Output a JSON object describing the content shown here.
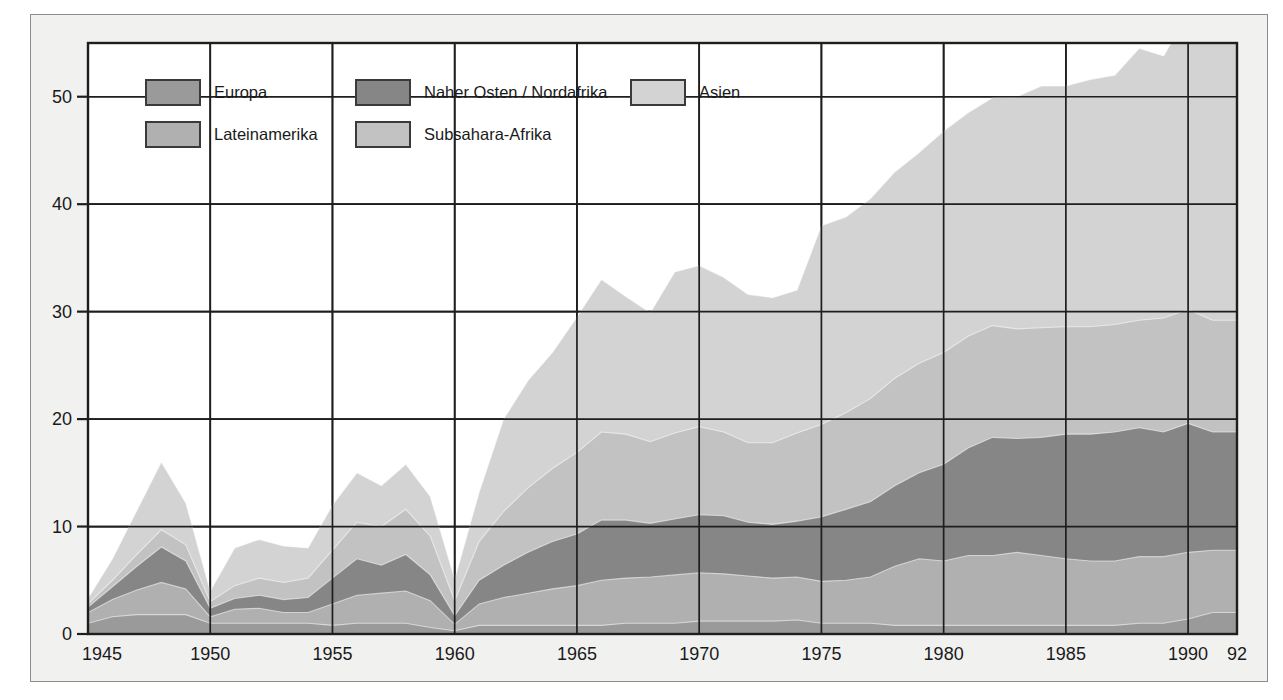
{
  "figure": {
    "background": "#ffffff",
    "panel_background": "#f1f1f0",
    "plot_background": "#ffffff",
    "frame_border": "#8d8d8d"
  },
  "legend": {
    "position": "inside-top-left",
    "entries": [
      {
        "label": "Europa",
        "color": "#9a9a9a",
        "row": 0,
        "col": 0
      },
      {
        "label": "Naher Osten / Nordafrika",
        "color": "#868686",
        "row": 0,
        "col": 1
      },
      {
        "label": "Asien",
        "color": "#d3d3d3",
        "row": 0,
        "col": 2
      },
      {
        "label": "Lateinamerika",
        "color": "#b0b0b0",
        "row": 1,
        "col": 0
      },
      {
        "label": "Subsahara-Afrika",
        "color": "#c2c2c2",
        "row": 1,
        "col": 1
      }
    ]
  },
  "axes": {
    "y_ticks": [
      "0",
      "10",
      "20",
      "30",
      "40",
      "50"
    ],
    "x_ticks": [
      "1945",
      "1950",
      "1955",
      "1960",
      "1965",
      "1970",
      "1975",
      "1980",
      "1985",
      "1990",
      "92"
    ]
  },
  "chart_data": {
    "type": "area",
    "title": "",
    "subtitle": "",
    "xlabel": "",
    "ylabel": "",
    "stacked": true,
    "grid": true,
    "legend_position": "inside-top-left",
    "xlim": [
      1945,
      1992
    ],
    "ylim": [
      0,
      55
    ],
    "y_tick_values": [
      0,
      10,
      20,
      30,
      40,
      50
    ],
    "x_tick_values": [
      1945,
      1950,
      1955,
      1960,
      1965,
      1970,
      1975,
      1980,
      1985,
      1990,
      1992
    ],
    "x": [
      1945,
      1946,
      1947,
      1948,
      1949,
      1950,
      1951,
      1952,
      1953,
      1954,
      1955,
      1956,
      1957,
      1958,
      1959,
      1960,
      1961,
      1962,
      1963,
      1964,
      1965,
      1966,
      1967,
      1968,
      1969,
      1970,
      1971,
      1972,
      1973,
      1974,
      1975,
      1976,
      1977,
      1978,
      1979,
      1980,
      1981,
      1982,
      1983,
      1984,
      1985,
      1986,
      1987,
      1988,
      1989,
      1990,
      1991,
      1992
    ],
    "series": [
      {
        "name": "Europa",
        "color": "#9a9a9a",
        "values": [
          1.0,
          1.6,
          1.8,
          1.8,
          1.8,
          1.0,
          1.0,
          1.0,
          1.0,
          1.0,
          0.8,
          1.0,
          1.0,
          1.0,
          0.6,
          0.3,
          0.8,
          0.8,
          0.8,
          0.8,
          0.8,
          0.8,
          1.0,
          1.0,
          1.0,
          1.2,
          1.2,
          1.2,
          1.2,
          1.3,
          1.0,
          1.0,
          1.0,
          0.8,
          0.8,
          0.8,
          0.8,
          0.8,
          0.8,
          0.8,
          0.8,
          0.8,
          0.8,
          1.0,
          1.0,
          1.4,
          2.0,
          2.0
        ]
      },
      {
        "name": "Lateinamerika",
        "color": "#b0b0b0",
        "values": [
          1.0,
          1.6,
          2.3,
          3.0,
          2.4,
          0.6,
          1.3,
          1.4,
          1.0,
          1.0,
          2.0,
          2.6,
          2.8,
          3.0,
          2.5,
          0.6,
          2.0,
          2.6,
          3.0,
          3.4,
          3.7,
          4.2,
          4.2,
          4.3,
          4.5,
          4.5,
          4.4,
          4.2,
          4.0,
          4.0,
          3.9,
          4.0,
          4.3,
          5.5,
          6.2,
          6.0,
          6.5,
          6.5,
          6.8,
          6.5,
          6.2,
          6.0,
          6.0,
          6.2,
          6.2,
          6.2,
          5.8,
          5.8
        ]
      },
      {
        "name": "Naher Osten / Nordafrika",
        "color": "#868686",
        "values": [
          0.5,
          1.2,
          2.2,
          3.3,
          2.6,
          0.8,
          1.0,
          1.2,
          1.2,
          1.4,
          2.4,
          3.4,
          2.6,
          3.4,
          2.4,
          0.8,
          2.2,
          3.0,
          3.8,
          4.4,
          4.8,
          5.6,
          5.4,
          5.0,
          5.2,
          5.4,
          5.4,
          5.0,
          5.0,
          5.2,
          6.0,
          6.6,
          7.0,
          7.5,
          8.0,
          9.0,
          10.0,
          11.0,
          10.6,
          11.0,
          11.6,
          11.8,
          12.0,
          12.0,
          11.6,
          12.0,
          11.0,
          11.0
        ]
      },
      {
        "name": "Subsahara-Afrika",
        "color": "#c2c2c2",
        "values": [
          0.3,
          0.6,
          1.1,
          1.6,
          1.5,
          0.6,
          1.2,
          1.6,
          1.6,
          1.8,
          2.6,
          3.4,
          3.6,
          4.2,
          3.6,
          1.4,
          3.6,
          5.0,
          6.0,
          6.8,
          7.6,
          8.2,
          8.0,
          7.6,
          8.0,
          8.2,
          7.8,
          7.4,
          7.6,
          8.2,
          8.6,
          9.0,
          9.6,
          10.0,
          10.2,
          10.4,
          10.4,
          10.4,
          10.2,
          10.2,
          10.0,
          10.0,
          10.0,
          10.0,
          10.6,
          10.6,
          10.4,
          10.4
        ]
      },
      {
        "name": "Asien",
        "color": "#d3d3d3",
        "values": [
          0.5,
          2.0,
          4.1,
          6.3,
          3.9,
          1.0,
          3.5,
          3.6,
          3.4,
          2.8,
          4.2,
          4.6,
          3.8,
          4.2,
          3.7,
          2.0,
          4.6,
          8.6,
          10.0,
          10.8,
          12.6,
          14.2,
          12.8,
          12.0,
          15.0,
          15.0,
          14.4,
          13.8,
          13.5,
          13.3,
          18.5,
          18.2,
          18.6,
          19.2,
          19.6,
          20.6,
          20.8,
          21.2,
          21.6,
          22.5,
          22.4,
          23.0,
          23.2,
          25.3,
          24.4,
          27.6,
          30.0,
          30.0
        ]
      }
    ]
  }
}
